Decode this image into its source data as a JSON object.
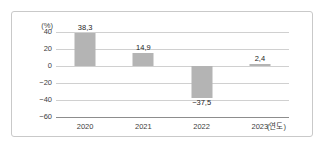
{
  "chart_data": {
    "type": "bar",
    "title": "",
    "subtitle": "",
    "xlabel": "(연도)",
    "ylabel": "(%)",
    "categories": [
      "2020",
      "2021",
      "2022",
      "2023"
    ],
    "values": [
      38.3,
      14.9,
      -37.5,
      2.4
    ],
    "value_labels": [
      "38,3",
      "14,9",
      "−37,5",
      "2,4"
    ],
    "ylim": [
      -60,
      40
    ],
    "yticks": [
      40,
      20,
      0,
      -20,
      -40,
      -60
    ],
    "ytick_labels": [
      "40",
      "20",
      "0",
      "−20",
      "−40",
      "−60"
    ],
    "grid": true,
    "legend": "none",
    "series": [
      {
        "name": "",
        "values": [
          38.3,
          14.9,
          -37.5,
          2.4
        ]
      }
    ],
    "colors": {
      "bar": "#b4b4b4",
      "gridline": "#d0d0d0",
      "axis": "#8d8d8d",
      "frame": "#c9c9c9",
      "text": "#3d3d3d",
      "label_text": "#1d1d1d",
      "background": "#ffffff"
    }
  }
}
